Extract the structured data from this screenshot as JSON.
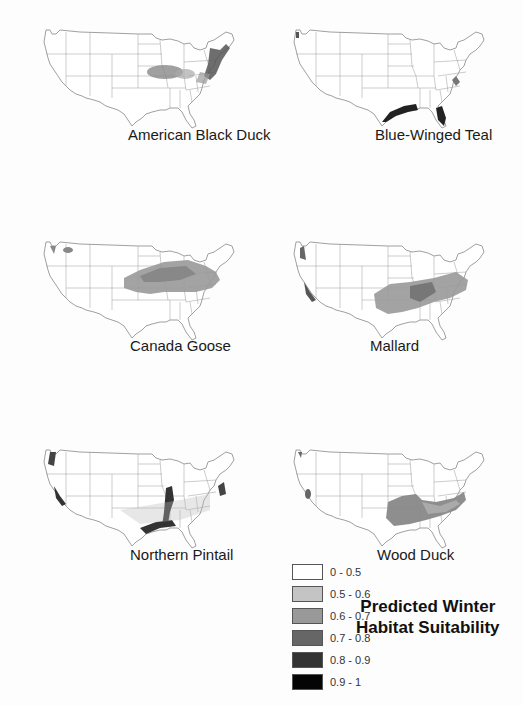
{
  "figure": {
    "title_line1": "Predicted Winter",
    "title_line2": "Habitat Suitability"
  },
  "maps": [
    {
      "species": "American Black Duck"
    },
    {
      "species": "Blue-Winged Teal"
    },
    {
      "species": "Canada Goose"
    },
    {
      "species": "Mallard"
    },
    {
      "species": "Northern Pintail"
    },
    {
      "species": "Wood Duck"
    }
  ],
  "legend": {
    "items": [
      {
        "range": "0 - 0.5",
        "color": "#ffffff"
      },
      {
        "range": "0.5 - 0.6",
        "color": "#c4c4c4"
      },
      {
        "range": "0.6 - 0.7",
        "color": "#999999"
      },
      {
        "range": "0.7 - 0.8",
        "color": "#666666"
      },
      {
        "range": "0.8 - 0.9",
        "color": "#333333"
      },
      {
        "range": "0.9 - 1",
        "color": "#050505"
      }
    ]
  }
}
